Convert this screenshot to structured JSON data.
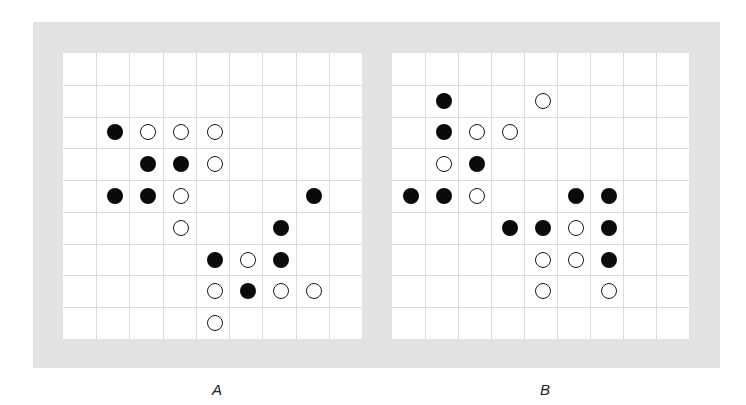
{
  "figure": {
    "panels": [
      {
        "id": "A",
        "label": "A",
        "grid": {
          "cols": 9,
          "rows": 9,
          "left": 63,
          "top": 53,
          "width": 299,
          "height": 286
        },
        "stones": [
          {
            "row": 2,
            "col": 1,
            "color": "black"
          },
          {
            "row": 2,
            "col": 2,
            "color": "white"
          },
          {
            "row": 2,
            "col": 3,
            "color": "white"
          },
          {
            "row": 2,
            "col": 4,
            "color": "white"
          },
          {
            "row": 3,
            "col": 2,
            "color": "black"
          },
          {
            "row": 3,
            "col": 3,
            "color": "black"
          },
          {
            "row": 3,
            "col": 4,
            "color": "white"
          },
          {
            "row": 4,
            "col": 1,
            "color": "black"
          },
          {
            "row": 4,
            "col": 2,
            "color": "black"
          },
          {
            "row": 4,
            "col": 3,
            "color": "white"
          },
          {
            "row": 4,
            "col": 7,
            "color": "black"
          },
          {
            "row": 5,
            "col": 3,
            "color": "white"
          },
          {
            "row": 5,
            "col": 6,
            "color": "black"
          },
          {
            "row": 6,
            "col": 4,
            "color": "black"
          },
          {
            "row": 6,
            "col": 5,
            "color": "white"
          },
          {
            "row": 6,
            "col": 6,
            "color": "black"
          },
          {
            "row": 7,
            "col": 4,
            "color": "white"
          },
          {
            "row": 7,
            "col": 5,
            "color": "black"
          },
          {
            "row": 7,
            "col": 6,
            "color": "white"
          },
          {
            "row": 7,
            "col": 7,
            "color": "white"
          },
          {
            "row": 8,
            "col": 4,
            "color": "white"
          }
        ]
      },
      {
        "id": "B",
        "label": "B",
        "grid": {
          "cols": 9,
          "rows": 9,
          "left": 392,
          "top": 53,
          "width": 297,
          "height": 286
        },
        "stones": [
          {
            "row": 1,
            "col": 1,
            "color": "black"
          },
          {
            "row": 1,
            "col": 4,
            "color": "white"
          },
          {
            "row": 2,
            "col": 1,
            "color": "black"
          },
          {
            "row": 2,
            "col": 2,
            "color": "white"
          },
          {
            "row": 2,
            "col": 3,
            "color": "white"
          },
          {
            "row": 3,
            "col": 1,
            "color": "white"
          },
          {
            "row": 3,
            "col": 2,
            "color": "black"
          },
          {
            "row": 4,
            "col": 0,
            "color": "black"
          },
          {
            "row": 4,
            "col": 1,
            "color": "black"
          },
          {
            "row": 4,
            "col": 2,
            "color": "white"
          },
          {
            "row": 4,
            "col": 5,
            "color": "black"
          },
          {
            "row": 4,
            "col": 6,
            "color": "black"
          },
          {
            "row": 5,
            "col": 3,
            "color": "black"
          },
          {
            "row": 5,
            "col": 4,
            "color": "black"
          },
          {
            "row": 5,
            "col": 5,
            "color": "white"
          },
          {
            "row": 5,
            "col": 6,
            "color": "black"
          },
          {
            "row": 6,
            "col": 4,
            "color": "white"
          },
          {
            "row": 6,
            "col": 5,
            "color": "white"
          },
          {
            "row": 6,
            "col": 6,
            "color": "black"
          },
          {
            "row": 7,
            "col": 4,
            "color": "white"
          },
          {
            "row": 7,
            "col": 6,
            "color": "white"
          }
        ]
      }
    ],
    "colors": {
      "frame": "#e2e2e2",
      "grid_line": "#dcdcdc",
      "black_stone": "#0a0a0a",
      "white_stone_border": "#1a1a1a"
    }
  }
}
